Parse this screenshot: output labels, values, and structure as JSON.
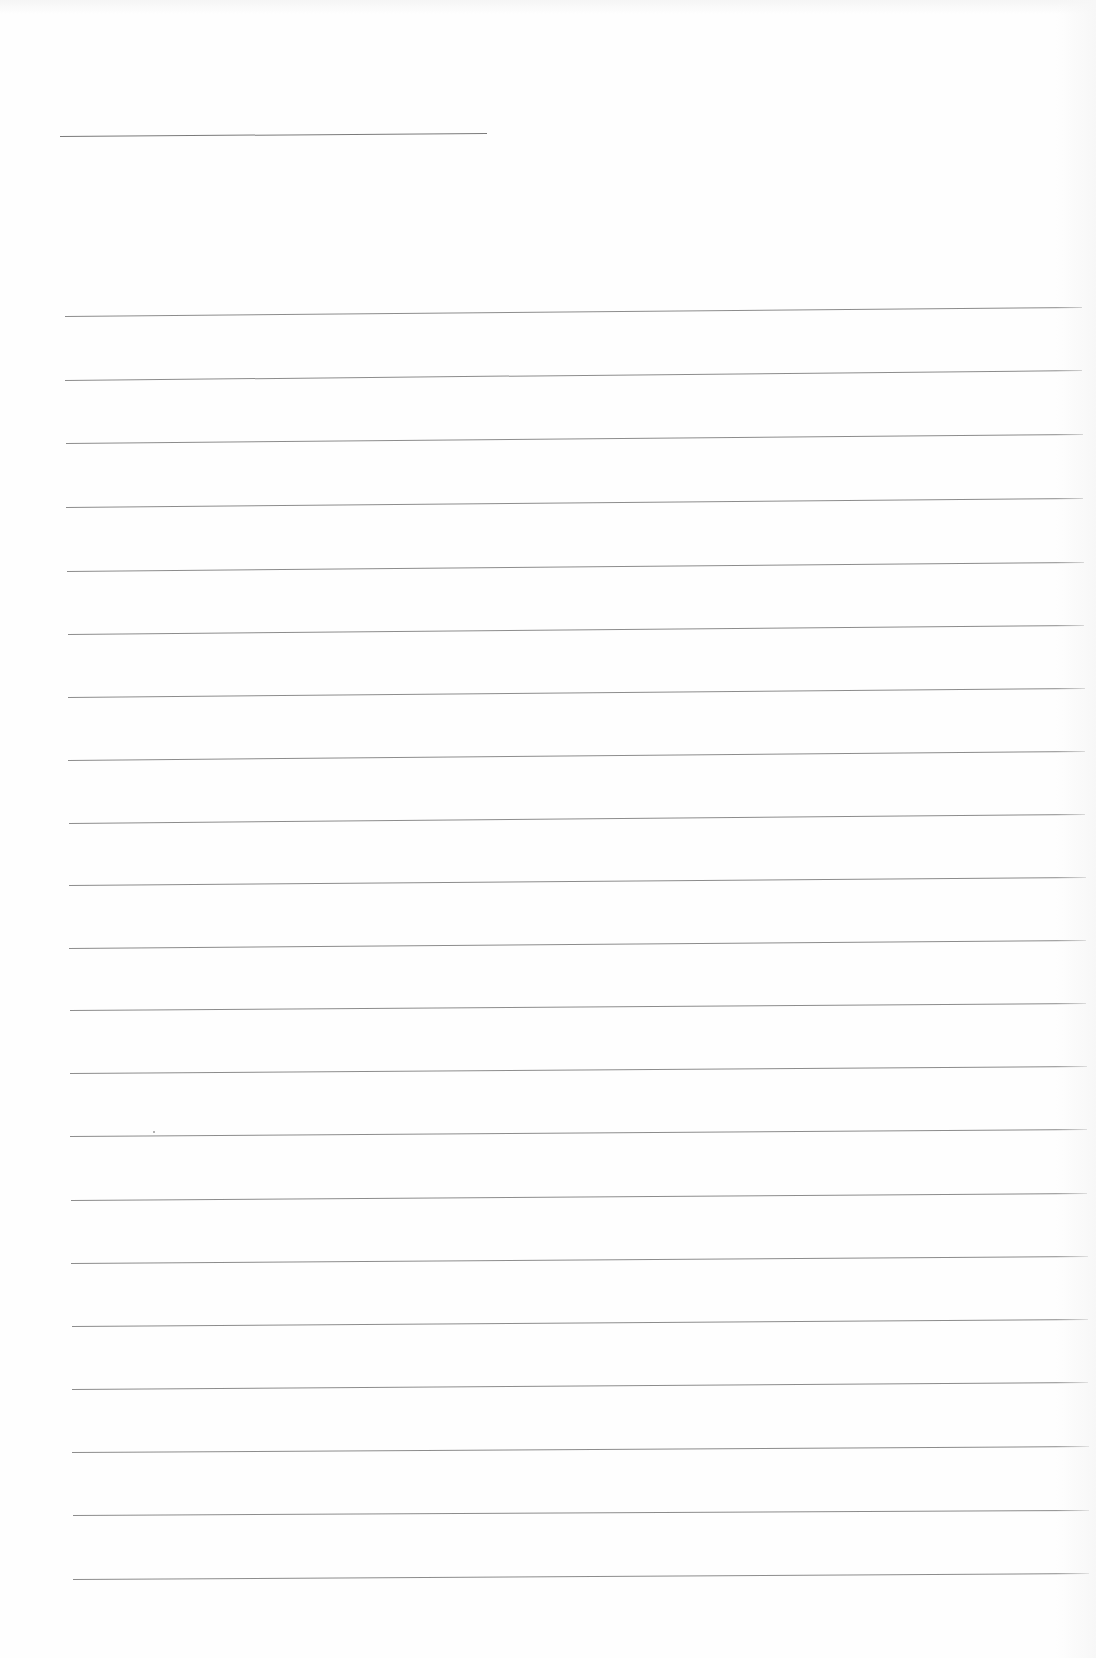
{
  "page": {
    "type": "blank-lined-paper",
    "background": "#fefefe",
    "line_color": "#8c8c8c"
  },
  "header_rule": {
    "x1": 60,
    "y1": 136,
    "x2": 487,
    "y2": 133
  },
  "ruled_lines": [
    {
      "x1": 65,
      "y1": 316,
      "x2": 1082,
      "y2": 307
    },
    {
      "x1": 65,
      "y1": 380,
      "x2": 1082,
      "y2": 370
    },
    {
      "x1": 66,
      "y1": 443,
      "x2": 1083,
      "y2": 434
    },
    {
      "x1": 66,
      "y1": 507,
      "x2": 1083,
      "y2": 498
    },
    {
      "x1": 67,
      "y1": 571,
      "x2": 1084,
      "y2": 562
    },
    {
      "x1": 68,
      "y1": 634,
      "x2": 1084,
      "y2": 625
    },
    {
      "x1": 68,
      "y1": 697,
      "x2": 1085,
      "y2": 688
    },
    {
      "x1": 68,
      "y1": 760,
      "x2": 1085,
      "y2": 751
    },
    {
      "x1": 69,
      "y1": 823,
      "x2": 1085,
      "y2": 814
    },
    {
      "x1": 69,
      "y1": 885,
      "x2": 1086,
      "y2": 877
    },
    {
      "x1": 69,
      "y1": 948,
      "x2": 1086,
      "y2": 940
    },
    {
      "x1": 70,
      "y1": 1010,
      "x2": 1086,
      "y2": 1003
    },
    {
      "x1": 70,
      "y1": 1073,
      "x2": 1087,
      "y2": 1066
    },
    {
      "x1": 70,
      "y1": 1136,
      "x2": 1087,
      "y2": 1129
    },
    {
      "x1": 71,
      "y1": 1200,
      "x2": 1087,
      "y2": 1193
    },
    {
      "x1": 71,
      "y1": 1263,
      "x2": 1088,
      "y2": 1256
    },
    {
      "x1": 72,
      "y1": 1326,
      "x2": 1088,
      "y2": 1319
    },
    {
      "x1": 72,
      "y1": 1389,
      "x2": 1088,
      "y2": 1382
    },
    {
      "x1": 72,
      "y1": 1452,
      "x2": 1089,
      "y2": 1446
    },
    {
      "x1": 73,
      "y1": 1515,
      "x2": 1089,
      "y2": 1510
    },
    {
      "x1": 73,
      "y1": 1579,
      "x2": 1089,
      "y2": 1573
    }
  ],
  "specks": [
    {
      "x": 153,
      "y": 1131
    }
  ]
}
